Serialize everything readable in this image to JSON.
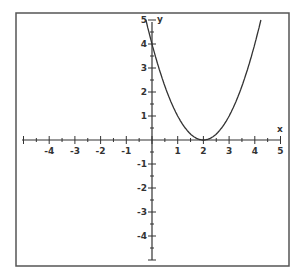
{
  "chart_data": {
    "type": "line",
    "title": "",
    "xlabel": "x",
    "ylabel": "y",
    "xlim": [
      -5,
      5
    ],
    "ylim": [
      -5,
      5
    ],
    "grid": false,
    "legend": null,
    "x_ticks": [
      -4,
      -3,
      -2,
      -1,
      1,
      2,
      3,
      4,
      5
    ],
    "y_ticks": [
      5,
      4,
      3,
      2,
      1,
      -1,
      -2,
      -3,
      -4
    ],
    "series": [
      {
        "name": "parabola",
        "function": "y = (x - 2)^2",
        "vertex": [
          2,
          0
        ],
        "y_intercept": 4,
        "x": [
          -0.24,
          0,
          0.5,
          1,
          1.5,
          2,
          2.5,
          3,
          3.5,
          4,
          4.24
        ],
        "values": [
          5.0,
          4,
          2.25,
          1,
          0.25,
          0,
          0.25,
          1,
          2.25,
          4,
          5.0
        ]
      }
    ]
  },
  "labels": {
    "x_axis": "x",
    "y_axis": "y"
  },
  "colors": {
    "axis": "#333333",
    "curve": "#333333",
    "frame": "#555555",
    "background": "#ffffff"
  }
}
